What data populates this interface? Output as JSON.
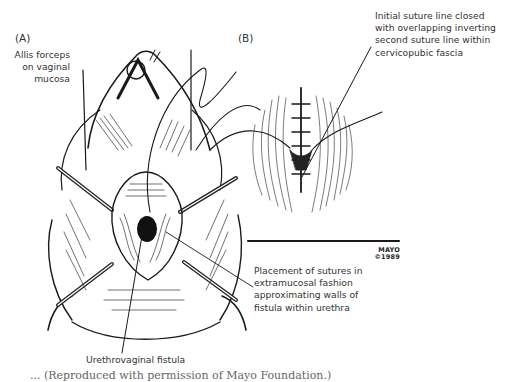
{
  "figure": {
    "panels": [
      {
        "tag": "(A)"
      },
      {
        "tag": "(B)"
      }
    ],
    "labels": {
      "allis_forceps": [
        "Allis forceps",
        "on vaginal",
        "mucosa"
      ],
      "initial_suture": [
        "Initial suture line closed",
        "with overlapping inverting",
        "second suture line within",
        "cervicopubic fascia"
      ],
      "placement_sutures": [
        "Placement of sutures in",
        "extramucosal fashion",
        "approximating walls of",
        "fistula within urethra"
      ],
      "urethrovaginal_fistula": "Urethrovaginal fistula"
    },
    "credit": {
      "line1": "MAYO",
      "line2": "©1989"
    },
    "caption_partial": "... (Reproduced with permission of Mayo Foundation.)"
  }
}
